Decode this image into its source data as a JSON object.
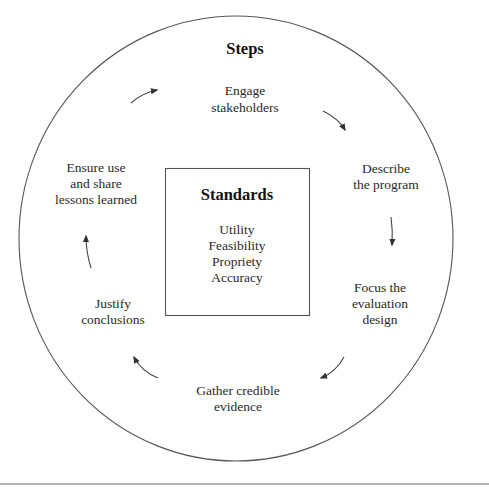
{
  "diagram": {
    "title": "Steps",
    "steps": [
      {
        "lines": [
          "Engage",
          "stakeholders"
        ]
      },
      {
        "lines": [
          "Describe",
          "the program"
        ]
      },
      {
        "lines": [
          "Focus the",
          "evaluation",
          "design"
        ]
      },
      {
        "lines": [
          "Gather credible",
          "evidence"
        ]
      },
      {
        "lines": [
          "Justify",
          "conclusions"
        ]
      },
      {
        "lines": [
          "Ensure use",
          "and share",
          "lessons learned"
        ]
      }
    ],
    "standards": {
      "title": "Standards",
      "items": [
        "Utility",
        "Feasibility",
        "Propriety",
        "Accuracy"
      ]
    },
    "arrows": [
      {
        "from": "Engage stakeholders",
        "to": "Describe the program",
        "direction": "clockwise"
      },
      {
        "from": "Describe the program",
        "to": "Focus the evaluation design",
        "direction": "clockwise"
      },
      {
        "from": "Focus the evaluation design",
        "to": "Gather credible evidence",
        "direction": "clockwise"
      },
      {
        "from": "Gather credible evidence",
        "to": "Justify conclusions",
        "direction": "clockwise"
      },
      {
        "from": "Justify conclusions",
        "to": "Ensure use and share lessons learned",
        "direction": "clockwise"
      },
      {
        "from": "Ensure use and share lessons learned",
        "to": "Engage stakeholders",
        "direction": "clockwise"
      }
    ],
    "colors": {
      "stroke": "#555555",
      "text": "#2a2a2a",
      "background": "#ffffff"
    }
  }
}
